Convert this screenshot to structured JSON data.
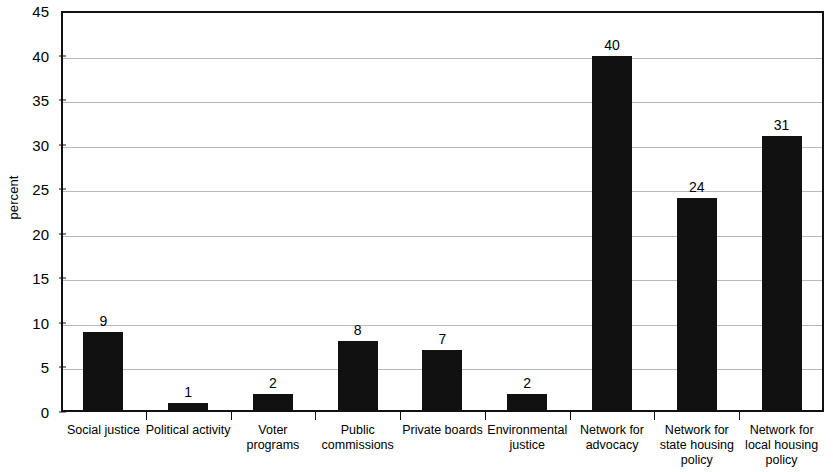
{
  "chart_data": {
    "type": "bar",
    "title": "",
    "subtitle": "",
    "xlabel": "",
    "ylabel": "percent",
    "ylim": [
      0,
      45
    ],
    "ytick_step": 5,
    "yticks": [
      0,
      5,
      10,
      15,
      20,
      25,
      30,
      35,
      40,
      45
    ],
    "grid": true,
    "legend": false,
    "legend_position": "none",
    "bar_color": "#111111",
    "show_value_labels": true,
    "categories": [
      "Social justice",
      "Political activity",
      "Voter\nprograms",
      "Public\ncommissions",
      "Private boards",
      "Environmental\njustice",
      "Network for\nadvocacy",
      "Network for\nstate housing\npolicy",
      "Network for\nlocal housing\npolicy"
    ],
    "values": [
      9,
      1,
      2,
      8,
      7,
      2,
      40,
      24,
      31
    ]
  },
  "axis": {
    "y_title": "percent",
    "y_tick_labels": [
      "0",
      "5",
      "10",
      "15",
      "20",
      "25",
      "30",
      "35",
      "40",
      "45"
    ]
  },
  "colors": {
    "bar": "#111111",
    "gridline": "#b8b8b8",
    "frame": "#111111",
    "background": "#ffffff"
  }
}
